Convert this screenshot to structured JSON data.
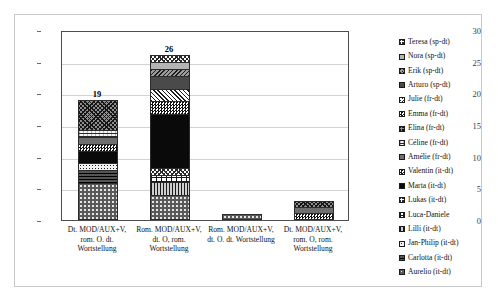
{
  "chart_data": {
    "type": "bar",
    "subtype": "stacked-column",
    "title": "",
    "xlabel": "",
    "ylabel": "",
    "ylim": [
      0,
      30
    ],
    "ytick_values": [
      0,
      5,
      10,
      15,
      20,
      25,
      30
    ],
    "ytick_labels": [
      "0",
      "5",
      "10",
      "15",
      "20",
      "25",
      "30"
    ],
    "grid": true,
    "legend_position": "right",
    "categories": [
      "Dt. MOD/AUX+V, rom. O. dt. Wortstellung",
      "Rom. MOD/AUX+V, dt. O, rom. Wortstellung",
      "Rom. MOD/AUX+V, dt. O. dt. Wortstellung",
      "Dt. MOD/AUX+V, rom. O, rom. Wortstellung"
    ],
    "category_lines": [
      [
        "Dt. MOD/AUX+V,",
        "rom. O. dt.",
        "Wortstellung"
      ],
      [
        "Rom. MOD/AUX+V,",
        "dt. O, rom.",
        "Wortstellung"
      ],
      [
        "Rom. MOD/AUX+V,",
        "dt. O. dt. Wortstellung"
      ],
      [
        "Dt. MOD/AUX+V,",
        "rom. O, rom.",
        "Wortstellung"
      ]
    ],
    "totals": [
      19,
      26,
      1,
      3
    ],
    "total_labels": [
      "19",
      "26",
      "",
      ""
    ],
    "series": [
      {
        "name": "Teresa (sp-dt)",
        "pattern": "p-crosshatch-lt",
        "values": [
          0,
          1,
          0,
          0
        ]
      },
      {
        "name": "Nora (sp-dt)",
        "pattern": "p-solid-ltgray",
        "values": [
          0,
          1,
          0,
          0
        ]
      },
      {
        "name": "Erik (sp-dt)",
        "pattern": "p-diag-back-gray",
        "values": [
          0,
          1,
          0,
          0
        ]
      },
      {
        "name": "Arturo (sp-dt)",
        "pattern": "p-solid-dkgray",
        "values": [
          0,
          2,
          0,
          0
        ]
      },
      {
        "name": "Julie (fr-dt)",
        "pattern": "p-diag-fwd",
        "values": [
          0,
          2,
          0,
          0
        ]
      },
      {
        "name": "Emma (fr-dt)",
        "pattern": "p-checker",
        "values": [
          0,
          2,
          0,
          0
        ]
      },
      {
        "name": "Elina (fr-dt)",
        "pattern": "p-crosshatch",
        "values": [
          5,
          0,
          0,
          1
        ]
      },
      {
        "name": "Céline (fr-dt)",
        "pattern": "p-wave",
        "values": [
          1,
          0,
          0,
          0
        ]
      },
      {
        "name": "Amélie (fr-dt)",
        "pattern": "p-solid-mdgray",
        "values": [
          1,
          0,
          0,
          1
        ]
      },
      {
        "name": "Valentin (it-dt)",
        "pattern": "p-checker",
        "values": [
          1,
          0,
          0,
          1
        ]
      },
      {
        "name": "Marta (it-dt)",
        "pattern": "p-solid-black",
        "values": [
          2,
          9,
          0,
          0
        ]
      },
      {
        "name": "Lukas (it-dt)",
        "pattern": "p-crosshatch-lt",
        "values": [
          0,
          1,
          0,
          0
        ]
      },
      {
        "name": "Luca-Daniele",
        "pattern": "p-brick",
        "values": [
          0,
          1,
          0,
          0
        ]
      },
      {
        "name": "Lilli (it-dt)",
        "pattern": "p-vlines",
        "values": [
          0,
          2,
          0,
          0
        ]
      },
      {
        "name": "Jan-Philip (it-dt)",
        "pattern": "p-dots-light",
        "values": [
          1,
          0,
          0,
          0
        ]
      },
      {
        "name": "Carlotta (it-dt)",
        "pattern": "p-hlines-dk",
        "values": [
          2,
          0,
          0,
          0
        ]
      },
      {
        "name": "Aurelio (it-dt)",
        "pattern": "p-sparse-dot",
        "values": [
          6,
          4,
          1,
          0
        ]
      }
    ]
  },
  "legend": {
    "items": [
      {
        "label": "Teresa (sp-dt)",
        "pattern": "p-crosshatch-lt"
      },
      {
        "label": "Nora (sp-dt)",
        "pattern": "p-solid-ltgray"
      },
      {
        "label": "Erik (sp-dt)",
        "pattern": "p-diag-back-gray"
      },
      {
        "label": "Arturo (sp-dt)",
        "pattern": "p-solid-dkgray"
      },
      {
        "label": "Julie (fr-dt)",
        "pattern": "p-diag-fwd"
      },
      {
        "label": "Emma (fr-dt)",
        "pattern": "p-checker"
      },
      {
        "label": "Elina (fr-dt)",
        "pattern": "p-crosshatch"
      },
      {
        "label": "Céline (fr-dt)",
        "pattern": "p-wave"
      },
      {
        "label": "Amélie (fr-dt)",
        "pattern": "p-solid-mdgray"
      },
      {
        "label": "Valentin (it-dt)",
        "pattern": "p-checker"
      },
      {
        "label": "Marta (it-dt)",
        "pattern": "p-solid-black"
      },
      {
        "label": "Lukas (it-dt)",
        "pattern": "p-crosshatch-lt"
      },
      {
        "label": "Luca-Daniele",
        "pattern": "p-brick"
      },
      {
        "label": "Lilli (it-dt)",
        "pattern": "p-vlines"
      },
      {
        "label": "Jan-Philip (it-dt)",
        "pattern": "p-dots-light"
      },
      {
        "label": "Carlotta (it-dt)",
        "pattern": "p-hlines-dk"
      },
      {
        "label": "Aurelio (it-dt)",
        "pattern": "p-sparse-dot"
      }
    ]
  },
  "colors": {
    "plot_border": "#4d4d4d",
    "gridline": "#d2d2d2",
    "frame_border": "#c9c9c9",
    "background": "#ffffff",
    "text": "#111111"
  }
}
